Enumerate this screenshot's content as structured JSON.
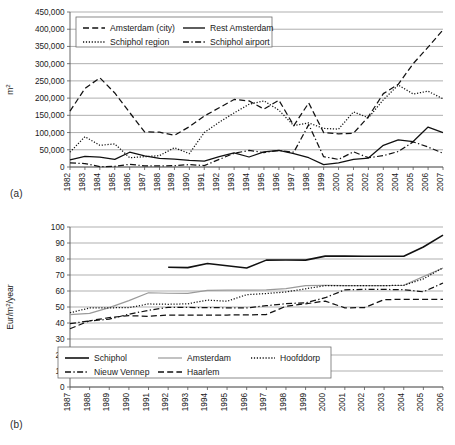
{
  "figure": {
    "panel_a_label": "(a)",
    "panel_b_label": "(b)"
  },
  "chart_data": [
    {
      "id": "a",
      "type": "line",
      "title": "",
      "xlabel": "",
      "ylabel": "m2",
      "ylabel_display": "m",
      "ylabel_sup": "2",
      "ylim": [
        0,
        450000
      ],
      "ytick_step": 50000,
      "yticks": [
        "0",
        "50,000",
        "100,000",
        "150,000",
        "200,000",
        "250,000",
        "300,000",
        "350,000",
        "400,000",
        "450,000"
      ],
      "grid": true,
      "legend_position": "top-left-inside",
      "categories": [
        "1982",
        "1983",
        "1984",
        "1985",
        "1986",
        "1987",
        "1988",
        "1989",
        "1990",
        "1991",
        "1992",
        "1993",
        "1994",
        "1995",
        "1996",
        "1997",
        "1998",
        "1999",
        "2000",
        "2001",
        "2002",
        "2003",
        "2004",
        "2005",
        "2006",
        "2007"
      ],
      "series": [
        {
          "name": "Amsterdam (city)",
          "style": "dashed",
          "color": "#111111",
          "values": [
            162000,
            228000,
            259000,
            215000,
            158000,
            102000,
            101000,
            92000,
            117000,
            148000,
            172000,
            196000,
            192000,
            168000,
            194000,
            120000,
            186000,
            100000,
            96000,
            98000,
            146000,
            213000,
            240000,
            300000,
            348000,
            398000
          ]
        },
        {
          "name": "Rest Amsterdam",
          "style": "solid",
          "color": "#111111",
          "values": [
            21000,
            31000,
            29000,
            22000,
            43000,
            32000,
            25000,
            23000,
            19000,
            17000,
            30000,
            41000,
            29000,
            44000,
            48000,
            39000,
            27000,
            7000,
            12000,
            22000,
            26000,
            63000,
            79000,
            74000,
            116000,
            100000
          ]
        },
        {
          "name": "Schiphol region",
          "style": "dotted",
          "color": "#111111",
          "values": [
            43000,
            88000,
            63000,
            67000,
            27000,
            30000,
            33000,
            56000,
            39000,
            100000,
            130000,
            157000,
            182000,
            192000,
            165000,
            120000,
            128000,
            112000,
            110000,
            160000,
            143000,
            195000,
            238000,
            212000,
            220000,
            198000
          ]
        },
        {
          "name": "Schiphol airport",
          "style": "dashdot",
          "color": "#111111",
          "values": [
            12000,
            10000,
            1000,
            2000,
            8000,
            3000,
            3000,
            4000,
            7000,
            4000,
            22000,
            40000,
            48000,
            42000,
            48000,
            43000,
            123000,
            30000,
            22000,
            44000,
            27000,
            33000,
            45000,
            73000,
            58000,
            40000
          ]
        }
      ]
    },
    {
      "id": "b",
      "type": "line",
      "title": "",
      "xlabel": "",
      "ylabel": "Eur/m2/year",
      "ylabel_pre": "Eur/m",
      "ylabel_sup": "2",
      "ylabel_post": "/year",
      "ylim": [
        0,
        100
      ],
      "ytick_step": 10,
      "yticks": [
        "0",
        "10",
        "20",
        "30",
        "40",
        "50",
        "60",
        "70",
        "80",
        "90",
        "100"
      ],
      "grid": true,
      "legend_position": "bottom-left-inside",
      "categories": [
        "1987",
        "1988",
        "1989",
        "1990",
        "1991",
        "1992",
        "1993",
        "1994",
        "1995",
        "1996",
        "1997",
        "1998",
        "1999",
        "2000",
        "2001",
        "2002",
        "2003",
        "2004",
        "2005",
        "2006"
      ],
      "series": [
        {
          "name": "Schiphol",
          "style": "solid",
          "color": "#111111",
          "width": 1.6,
          "values": [
            null,
            null,
            null,
            null,
            null,
            74.8,
            74.6,
            77.2,
            75.8,
            74.4,
            79.3,
            79.4,
            79.3,
            81.8,
            81.8,
            81.7,
            81.7,
            81.7,
            87.5,
            94.9
          ]
        },
        {
          "name": "Amsterdam",
          "style": "solid",
          "color": "#9a9a9a",
          "width": 1.2,
          "values": [
            45.2,
            46.0,
            49.6,
            54.0,
            58.9,
            58.6,
            58.5,
            60.4,
            60.5,
            60.6,
            60.7,
            61.5,
            63.4,
            63.5,
            63.4,
            63.4,
            63.4,
            63.6,
            69.0,
            74.4
          ]
        },
        {
          "name": "Hoofddorp",
          "style": "dotted",
          "color": "#111111",
          "values": [
            46.4,
            49.4,
            49.5,
            49.6,
            51.9,
            51.7,
            52.0,
            54.3,
            53.6,
            57.7,
            58.4,
            59.4,
            61.4,
            63.3,
            63.4,
            63.4,
            63.4,
            63.5,
            67.6,
            74.5
          ]
        },
        {
          "name": "Nieuw Vennep",
          "style": "dashdot",
          "color": "#111111",
          "values": [
            39.6,
            41.3,
            42.4,
            45.5,
            47.9,
            49.8,
            49.7,
            49.6,
            49.5,
            49.4,
            50.8,
            52.1,
            52.6,
            55.8,
            60.7,
            61.1,
            61.0,
            60.8,
            59.5,
            65.0
          ]
        },
        {
          "name": "Haarlem",
          "style": "dashed",
          "color": "#111111",
          "values": [
            36.4,
            41.4,
            43.4,
            44.6,
            44.2,
            45.0,
            45.0,
            45.0,
            45.0,
            45.1,
            45.3,
            50.5,
            52.0,
            53.7,
            49.5,
            49.6,
            54.6,
            54.8,
            54.7,
            54.7
          ]
        }
      ]
    }
  ]
}
